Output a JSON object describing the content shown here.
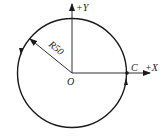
{
  "diagram": {
    "type": "circle-interpolation",
    "colors": {
      "stroke": "#1a1a1a",
      "background": "#ffffff"
    },
    "center_label": "O",
    "point_label": "C",
    "radius_label": "R50",
    "axes": {
      "x_label": "+X",
      "y_label": "+Y"
    },
    "direction": "counterclockwise"
  }
}
